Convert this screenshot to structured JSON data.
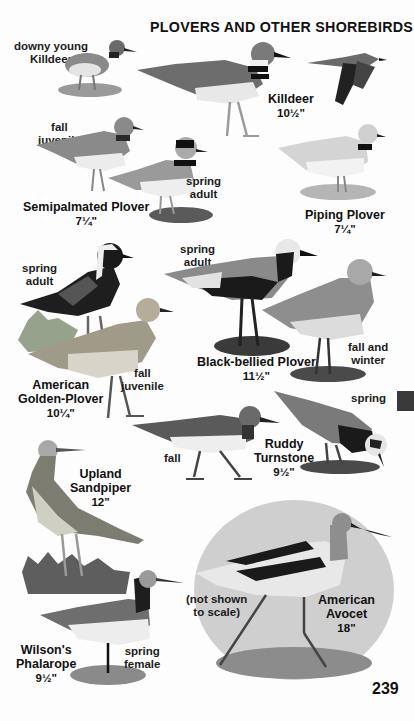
{
  "page": {
    "title": "PLOVERS AND OTHER SHOREBIRDS",
    "page_number": "239",
    "thumb_tab_color": "#3a3a3a",
    "background_color": "#fdfdfd"
  },
  "species": [
    {
      "name": "Killdeer",
      "size": "10½\"",
      "plumages": [
        {
          "label": "downy young Killdeer",
          "lines": [
            "downy young",
            "Killdeer"
          ]
        },
        {
          "label": "adult standing"
        },
        {
          "label": "adult in flight"
        }
      ]
    },
    {
      "name": "Semipalmated Plover",
      "size": "7¼\"",
      "plumages": [
        {
          "label": "fall juvenile",
          "lines": [
            "fall",
            "juvenile"
          ]
        },
        {
          "label": "spring adult",
          "lines": [
            "spring",
            "adult"
          ]
        }
      ]
    },
    {
      "name": "Piping Plover",
      "size": "7¼\"",
      "plumages": []
    },
    {
      "name": "American Golden-Plover",
      "name_lines": [
        "American",
        "Golden-Plover"
      ],
      "size": "10¼\"",
      "plumages": [
        {
          "label": "spring adult",
          "lines": [
            "spring",
            "adult"
          ]
        },
        {
          "label": "fall juvenile",
          "lines": [
            "fall",
            "juvenile"
          ]
        }
      ]
    },
    {
      "name": "Black-bellied Plover",
      "size": "11½\"",
      "plumages": [
        {
          "label": "spring adult",
          "lines": [
            "spring",
            "adult"
          ]
        },
        {
          "label": "fall and winter",
          "lines": [
            "fall and",
            "winter"
          ]
        }
      ]
    },
    {
      "name": "Ruddy Turnstone",
      "name_lines": [
        "Ruddy",
        "Turnstone"
      ],
      "size": "9½\"",
      "plumages": [
        {
          "label": "fall",
          "lines": [
            "fall"
          ]
        },
        {
          "label": "spring",
          "lines": [
            "spring"
          ]
        }
      ]
    },
    {
      "name": "Upland Sandpiper",
      "name_lines": [
        "Upland",
        "Sandpiper"
      ],
      "size": "12\"",
      "plumages": []
    },
    {
      "name": "Wilson's Phalarope",
      "name_lines": [
        "Wilson's",
        "Phalarope"
      ],
      "size": "9½\"",
      "plumages": [
        {
          "label": "spring female",
          "lines": [
            "spring",
            "female"
          ]
        }
      ]
    },
    {
      "name": "American Avocet",
      "name_lines": [
        "American",
        "Avocet"
      ],
      "size": "18\"",
      "note": "(not shown to scale)",
      "note_lines": [
        "(not shown",
        "to scale)"
      ],
      "plumages": []
    }
  ]
}
